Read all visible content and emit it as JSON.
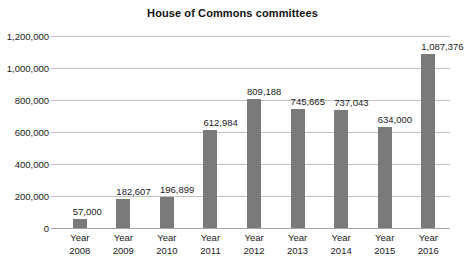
{
  "chart_data": {
    "type": "bar",
    "title": "House of Commons committees",
    "xlabel": "",
    "ylabel": "",
    "categories": [
      "Year 2008",
      "Year 2009",
      "Year 2010",
      "Year 2011",
      "Year 2012",
      "Year 2013",
      "Year 2014",
      "Year 2015",
      "Year 2016"
    ],
    "category_lines": [
      {
        "line1": "Year",
        "line2": "2008"
      },
      {
        "line1": "Year",
        "line2": "2009"
      },
      {
        "line1": "Year",
        "line2": "2010"
      },
      {
        "line1": "Year",
        "line2": "2011"
      },
      {
        "line1": "Year",
        "line2": "2012"
      },
      {
        "line1": "Year",
        "line2": "2013"
      },
      {
        "line1": "Year",
        "line2": "2014"
      },
      {
        "line1": "Year",
        "line2": "2015"
      },
      {
        "line1": "Year",
        "line2": "2016"
      }
    ],
    "values": [
      57000,
      182607,
      196899,
      612984,
      809188,
      745665,
      737043,
      634000,
      1087376
    ],
    "value_labels": [
      "57,000",
      "182,607",
      "196,899",
      "612,984",
      "809,188",
      "745,665",
      "737,043",
      "634,000",
      "1,087,376"
    ],
    "ylim": [
      0,
      1200000
    ],
    "yticks": [
      0,
      200000,
      400000,
      600000,
      800000,
      1000000,
      1200000
    ],
    "ytick_labels": [
      "0",
      "200,000",
      "400,000",
      "600,000",
      "800,000",
      "1,000,000",
      "1,200,000"
    ],
    "grid": true,
    "legend": false,
    "bar_color": "#7a7a7a",
    "grid_color": "#bfbfbf",
    "axis_color": "#a6a6a6",
    "background": "#ffffff"
  }
}
